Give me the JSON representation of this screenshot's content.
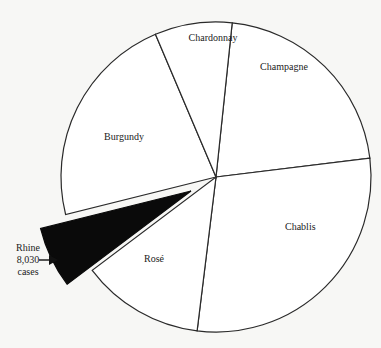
{
  "chart_data": {
    "type": "pie",
    "title": "",
    "unit": "cases",
    "center": [
      216,
      177
    ],
    "radius": 155,
    "start_angle_deg": 6,
    "slices": [
      {
        "label": "Champagne",
        "value": 26900,
        "degrees": 77,
        "exploded": false,
        "label_pos": [
          68,
          -107
        ],
        "align": "middle"
      },
      {
        "label": "Chablis",
        "value": 36300,
        "degrees": 104,
        "exploded": false,
        "label_pos": [
          69,
          53
        ],
        "align": "start"
      },
      {
        "label": "Rosé",
        "value": 16100,
        "degrees": 46,
        "exploded": false,
        "label_pos": [
          -72,
          85
        ],
        "align": "start"
      },
      {
        "label": "Rhine",
        "value": 8030,
        "degrees": 23,
        "exploded": true,
        "explode_offset": [
          -25,
          14
        ],
        "annotation": [
          "Rhine",
          "8,030",
          "cases"
        ]
      },
      {
        "label": "Burgundy",
        "value": 28300,
        "degrees": 81,
        "exploded": false,
        "label_pos": [
          -92,
          -37
        ],
        "align": "middle"
      },
      {
        "label": "Chardonnay",
        "value": 10100,
        "degrees": 29,
        "exploded": false,
        "label_pos": [
          -3,
          -136
        ],
        "align": "middle"
      }
    ],
    "annotations": [
      {
        "text_lines": [
          "Rhine",
          "8,030",
          "cases"
        ],
        "x": 28,
        "y": 255,
        "arrow_to": [
          58,
          265
        ]
      }
    ],
    "legend": null
  }
}
